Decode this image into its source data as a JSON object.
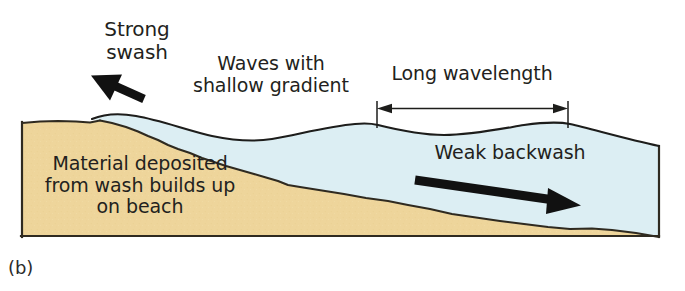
{
  "figure": {
    "caption": "(b)",
    "colors": {
      "sand": "#eed59b",
      "sand_edge": "#2f2a20",
      "water": "#dceef3",
      "water_edge": "#1d1d1b",
      "arrow": "#111111",
      "text": "#231f20",
      "background": "#ffffff"
    }
  },
  "labels": {
    "strong_swash": "Strong\nswash",
    "waves_shallow_gradient": "Waves with\nshallow gradient",
    "long_wavelength": "Long wavelength",
    "material_deposited": "Material deposited\nfrom wash builds up\non beach",
    "weak_backwash": "Weak backwash"
  },
  "annotations": {
    "swash_arrow": {
      "name": "strong-swash-arrow",
      "direction": "up-left",
      "from": [
        144,
        98
      ],
      "to": [
        93,
        77
      ]
    },
    "backwash_arrow": {
      "name": "weak-backwash-arrow",
      "direction": "right-down",
      "from": [
        414,
        180
      ],
      "to": [
        578,
        206
      ]
    },
    "wavelength_measure": {
      "name": "long-wavelength-measure",
      "style": "double-headed-arrow-with-end-ticks",
      "x_start": 376,
      "x_end": 568,
      "y": 108,
      "tick_top": 101,
      "tick_bottom": 128
    }
  },
  "geometry": {
    "frame": {
      "left": 22,
      "right": 659,
      "top_water": 118,
      "bottom": 237
    },
    "water_surface_note": "Long, low-amplitude waves: crest near x=120, trough near x=265, crest near x=375, trough near x=470, crest near x=568, falling to right edge.",
    "beach_note": "Sand wedge high at left (y=123) sloping gently down to the right to y=228 at the right edge; rough stepped seabed contour."
  }
}
